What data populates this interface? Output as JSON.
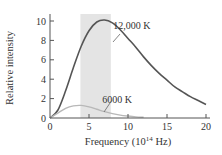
{
  "chart_data": {
    "type": "line",
    "title": "",
    "xlabel": "Frequency (10^14 Hz)",
    "xlabel_main": "Frequency (10",
    "xlabel_sup": "14",
    "xlabel_tail": " Hz)",
    "ylabel": "Relative intensity",
    "xlim": [
      0,
      20
    ],
    "ylim": [
      0,
      10.5
    ],
    "xticks": [
      0,
      5,
      10,
      15,
      20
    ],
    "yticks": [
      0,
      2,
      4,
      6,
      8,
      10
    ],
    "grid": false,
    "shaded_region": {
      "label": "visible band",
      "x_start": 3.9,
      "x_end": 7.8,
      "color": "#e4e4e4"
    },
    "series": [
      {
        "name": "12,000 K",
        "color": "#555555",
        "x": [
          0,
          1,
          2,
          3,
          4,
          5,
          6,
          7,
          8,
          9,
          10,
          11,
          12,
          13,
          14,
          15,
          16,
          17,
          18,
          19,
          20
        ],
        "values": [
          0,
          0.8,
          2.8,
          5.2,
          7.4,
          9.0,
          9.9,
          10.1,
          9.8,
          9.1,
          8.2,
          7.3,
          6.3,
          5.4,
          4.6,
          3.9,
          3.2,
          2.7,
          2.2,
          1.8,
          1.4
        ]
      },
      {
        "name": "6000 K",
        "color": "#b8b8b8",
        "x": [
          0,
          1,
          2,
          3,
          4,
          5,
          6,
          7,
          8,
          9,
          10,
          11,
          12
        ],
        "values": [
          0,
          0.5,
          1.0,
          1.25,
          1.3,
          1.15,
          0.9,
          0.65,
          0.45,
          0.3,
          0.2,
          0.12,
          0.07
        ]
      }
    ],
    "annotations": [
      {
        "text": "12,000 K",
        "x": 11.7,
        "y": 9.6
      },
      {
        "text": "6000 K",
        "x": 10.3,
        "y": 2.0
      }
    ]
  }
}
